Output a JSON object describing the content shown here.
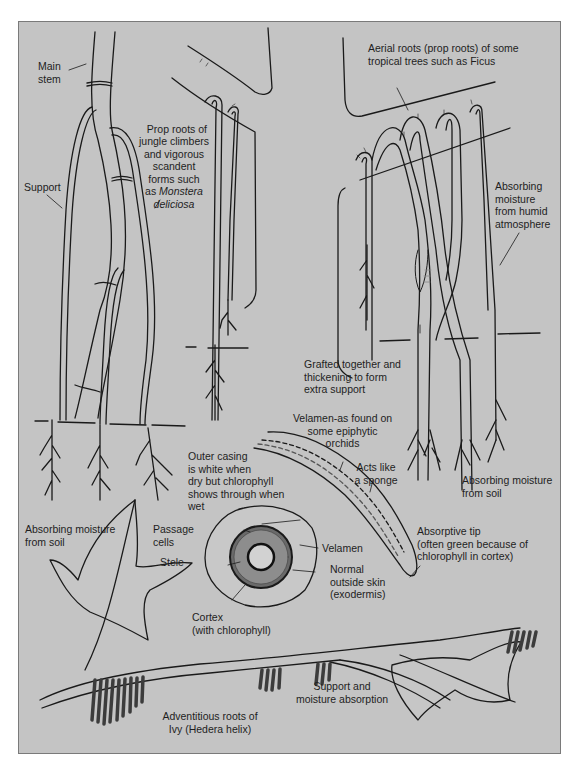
{
  "figure": {
    "caption": "",
    "panel_color": "#c4c4c4",
    "line_color": "#1a1a1a",
    "root_fill": "#4a4a4a"
  },
  "labels": {
    "main_stem": "Main\nstem",
    "support": "Support",
    "prop_roots_jungle": "Prop roots of\njungle climbers\nand vigorous\nscandent\nforms such\nas ",
    "monstera_genus": "Monstera",
    "monstera_species": "deliciosa",
    "aerial_roots": "Aerial roots (prop roots) of some\ntropical trees such as Ficus",
    "absorbing_humid": "Absorbing\nmoisture\nfrom humid\natmosphere",
    "grafted": "Grafted together and\nthickening to form\nextra support",
    "absorbing_soil_left": "Absorbing moisture\nfrom soil",
    "absorbing_soil_right": "Absorbing moisture\nfrom soil",
    "velamen_orchids": "Velamen-as found on\nsome epiphytic\norchids",
    "acts_like_sponge": "Acts like\na sponge",
    "outer_casing": "Outer casing\nis white when\ndry but chlorophyll\nshows through when\nwet",
    "passage_cells": "Passage\ncells",
    "stele": "Stele",
    "velamen": "Velamen",
    "normal_skin": "Normal\noutside skin\n(exodermis)",
    "absorptive_tip": "Absorptive tip\n(often green because of\nchlorophyll in cortex)",
    "cortex": "Cortex\n(with chlorophyll)",
    "support_moisture": "Support and\nmoisture absorption",
    "ivy_roots": "Adventitious roots of\nIvy (Hedera helix)"
  }
}
